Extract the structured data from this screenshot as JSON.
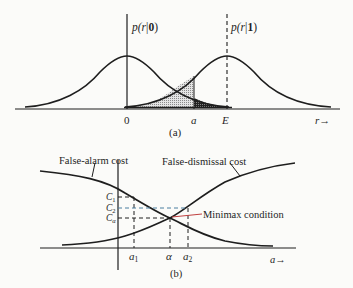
{
  "figure_a": {
    "caption": "(a)",
    "density_labels": {
      "p0_prefix": "p(",
      "p0_var": "r",
      "p0_bar": "|",
      "p0_cond": "0",
      "p0_close": ")",
      "p1_prefix": "p(",
      "p1_var": "r",
      "p1_bar": "|",
      "p1_cond": "1",
      "p1_close": ")"
    },
    "axis_ticks": {
      "zero": "0",
      "threshold": "a",
      "signal": "E"
    },
    "axis_label": "r",
    "axis_arrow": "→"
  },
  "figure_b": {
    "caption": "(b)",
    "curve_labels": {
      "false_alarm": "False-alarm cost",
      "false_dismissal": "False-dismissal cost"
    },
    "cost_ticks": {
      "c1_main": "C",
      "c1_sub": "1",
      "c2_main": "C",
      "c2_sub": "2",
      "ca_main": "C",
      "ca_sub": "α"
    },
    "x_ticks": {
      "a1_main": "a",
      "a1_sub": "1",
      "alpha": "α",
      "a2_main": "a",
      "a2_sub": "2"
    },
    "annotation": "Minimax condition",
    "axis_label": "a",
    "axis_arrow": "→"
  },
  "colors": {
    "ink": "#1e1e1e",
    "c2_dash": "#4a7fa0",
    "annotation_pointer": "#c04040",
    "background": "#fbfbf9"
  }
}
